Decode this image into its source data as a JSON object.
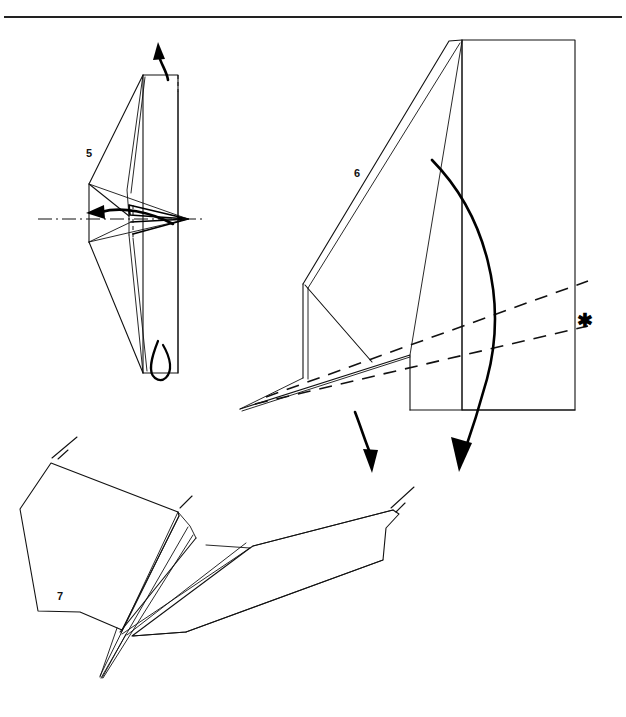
{
  "page": {
    "width": 626,
    "height": 717,
    "background_color": "#ffffff",
    "ink_color": "#111111",
    "kind": "origami-folding-instruction-diagram",
    "top_rule": {
      "present": true,
      "y": 17,
      "x_start": 4,
      "x_end": 622
    }
  },
  "figures": [
    {
      "id": "figure-5",
      "label": "5",
      "label_x": 86,
      "label_y": 157,
      "description": "Front view of partially folded model with vertical centre, dash-dot symmetry axis, rotate arrow pointing left, pull-up arrow at top and fold-under loop arrow at bottom"
    },
    {
      "id": "figure-6",
      "label": "6",
      "label_x": 354,
      "label_y": 177,
      "description": "Large side view of the model with two dashed valley-fold guide lines marked by an asterisk, a big curved fold-over arrow and a smaller downward fold arrow"
    },
    {
      "id": "figure-7",
      "label": "7",
      "label_x": 57,
      "label_y": 600,
      "description": "Completed step showing the model opened out into a winged shape with short fold tick marks"
    }
  ],
  "markers": [
    {
      "name": "asterisk-marker",
      "symbol": "✱",
      "x": 583,
      "y": 320,
      "refers_to": "dashed fold guide lines in figure 6"
    }
  ],
  "arrows": [
    {
      "name": "pull-up-arrow",
      "figure": "figure-5",
      "direction": "up",
      "style": "solid-curved-with-solid-head"
    },
    {
      "name": "rotate-left-arrow",
      "figure": "figure-5",
      "direction": "left",
      "style": "solid-curved-with-solid-head"
    },
    {
      "name": "fold-under-loop-arrow",
      "figure": "figure-5",
      "direction": "loop-under",
      "style": "open-loop"
    },
    {
      "name": "fold-over-arrow",
      "figure": "figure-6",
      "direction": "down-right-sweep",
      "style": "large-curved-with-solid-head"
    },
    {
      "name": "fold-down-arrow",
      "figure": "figure-6",
      "direction": "down",
      "style": "curved-with-solid-head"
    }
  ],
  "line_types": {
    "edge": "solid paper edge",
    "centerline": "dash-dot symmetry axis",
    "dashguide": "dashed valley fold guide",
    "hidden_fold": "short dashed hidden edge"
  }
}
